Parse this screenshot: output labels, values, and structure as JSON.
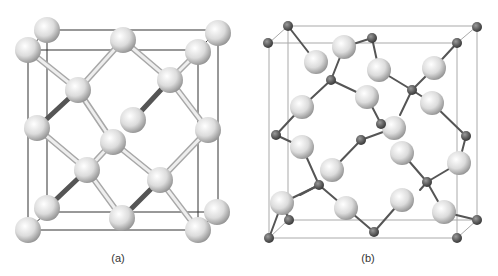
{
  "figure": {
    "panels": [
      {
        "id": "a",
        "caption": "(a)",
        "caption_pos": [
          118,
          252
        ],
        "cube": {
          "back": [
            47,
            30,
            218,
            212
          ],
          "front": [
            28,
            50,
            198,
            230
          ]
        },
        "atom_radius": 13,
        "atoms": [
          [
            47,
            30
          ],
          [
            218,
            33
          ],
          [
            123,
            40
          ],
          [
            28,
            50
          ],
          [
            198,
            52
          ],
          [
            170,
            80
          ],
          [
            78,
            90
          ],
          [
            133,
            120
          ],
          [
            37,
            128
          ],
          [
            208,
            130
          ],
          [
            113,
            142
          ],
          [
            87,
            170
          ],
          [
            160,
            180
          ],
          [
            47,
            208
          ],
          [
            217,
            212
          ],
          [
            122,
            218
          ],
          [
            28,
            230
          ],
          [
            198,
            230
          ]
        ],
        "bonds_light": [
          [
            28,
            50,
            78,
            90
          ],
          [
            78,
            90,
            113,
            142
          ],
          [
            113,
            142,
            160,
            180
          ],
          [
            160,
            180,
            198,
            230
          ],
          [
            123,
            40,
            170,
            80
          ],
          [
            170,
            80,
            208,
            130
          ],
          [
            37,
            128,
            87,
            170
          ],
          [
            87,
            170,
            122,
            218
          ],
          [
            113,
            142,
            87,
            170
          ],
          [
            160,
            180,
            208,
            130
          ],
          [
            78,
            90,
            123,
            40
          ],
          [
            170,
            80,
            198,
            52
          ]
        ],
        "bonds_dark": [
          [
            78,
            90,
            37,
            128
          ],
          [
            170,
            80,
            133,
            120
          ],
          [
            87,
            170,
            47,
            208
          ],
          [
            160,
            180,
            122,
            218
          ]
        ]
      },
      {
        "id": "b",
        "caption": "(b)",
        "caption_pos": [
          368,
          252
        ],
        "cube": {
          "back": [
            288,
            26,
            477,
            220
          ],
          "front": [
            269,
            43,
            457,
            238
          ]
        },
        "large_radius": 12,
        "small_radius": 5,
        "small_atoms": [
          [
            288,
            26
          ],
          [
            268,
            43
          ],
          [
            372,
            38
          ],
          [
            477,
            27
          ],
          [
            457,
            43
          ],
          [
            331,
            80
          ],
          [
            412,
            90
          ],
          [
            381,
            124
          ],
          [
            276,
            135
          ],
          [
            361,
            140
          ],
          [
            466,
            136
          ],
          [
            319,
            185
          ],
          [
            427,
            182
          ],
          [
            289,
            220
          ],
          [
            269,
            238
          ],
          [
            374,
            232
          ],
          [
            477,
            220
          ],
          [
            457,
            238
          ]
        ],
        "large_atoms": [
          [
            344,
            47
          ],
          [
            316,
            62
          ],
          [
            379,
            70
          ],
          [
            434,
            68
          ],
          [
            367,
            97
          ],
          [
            302,
            107
          ],
          [
            432,
            103
          ],
          [
            394,
            128
          ],
          [
            302,
            147
          ],
          [
            402,
            153
          ],
          [
            332,
            170
          ],
          [
            459,
            163
          ],
          [
            282,
            203
          ],
          [
            346,
            208
          ],
          [
            402,
            200
          ],
          [
            444,
            212
          ]
        ],
        "bonds": [
          [
            288,
            26,
            316,
            62
          ],
          [
            344,
            47,
            372,
            38
          ],
          [
            331,
            80,
            344,
            47
          ],
          [
            331,
            80,
            367,
            97
          ],
          [
            331,
            80,
            302,
            107
          ],
          [
            372,
            38,
            379,
            70
          ],
          [
            379,
            70,
            412,
            90
          ],
          [
            412,
            90,
            434,
            68
          ],
          [
            412,
            90,
            432,
            103
          ],
          [
            434,
            68,
            457,
            43
          ],
          [
            367,
            97,
            381,
            124
          ],
          [
            381,
            124,
            394,
            128
          ],
          [
            302,
            107,
            276,
            135
          ],
          [
            276,
            135,
            302,
            147
          ],
          [
            302,
            147,
            319,
            185
          ],
          [
            361,
            140,
            332,
            170
          ],
          [
            361,
            140,
            394,
            128
          ],
          [
            319,
            185,
            282,
            203
          ],
          [
            319,
            185,
            346,
            208
          ],
          [
            346,
            208,
            374,
            232
          ],
          [
            374,
            232,
            402,
            200
          ],
          [
            427,
            182,
            402,
            153
          ],
          [
            427,
            182,
            459,
            163
          ],
          [
            427,
            182,
            444,
            212
          ],
          [
            444,
            212,
            477,
            220
          ],
          [
            432,
            103,
            466,
            136
          ],
          [
            466,
            136,
            459,
            163
          ],
          [
            282,
            203,
            269,
            238
          ],
          [
            282,
            203,
            289,
            220
          ],
          [
            412,
            90,
            400,
            115
          ],
          [
            319,
            185,
            300,
            195
          ],
          [
            427,
            182,
            420,
            190
          ]
        ]
      }
    ]
  },
  "colors": {
    "large_atom_light": "#f4f4f4",
    "large_atom_dark": "#9a9a9a",
    "small_atom": "#555555",
    "bond_light": "#c8c8c8",
    "bond_dark": "#555555",
    "cube_line_a": "#333333",
    "cube_line_b": "#aaaaaa"
  }
}
